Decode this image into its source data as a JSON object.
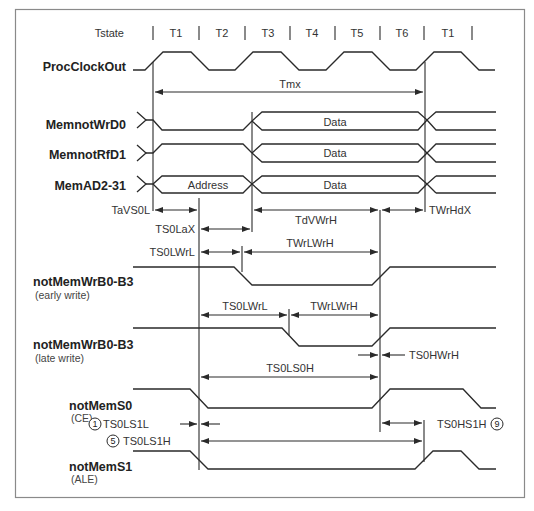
{
  "diagram": {
    "tstate_label": "Tstate",
    "tstates": [
      "T1",
      "T2",
      "T3",
      "T4",
      "T5",
      "T6",
      "T1"
    ],
    "signals": {
      "clock": "ProcClockOut",
      "wrd0": "MemnotWrD0",
      "rfd1": "MemnotRfD1",
      "ad": "MemAD2-31",
      "wr_early": "notMemWrB0-B3",
      "wr_early_sub": "(early write)",
      "wr_late": "notMemWrB0-B3",
      "wr_late_sub": "(late write)",
      "s0": "notMemS0",
      "s0_sub": "(CE)",
      "s1": "notMemS1",
      "s1_sub": "(ALE)"
    },
    "bus_labels": {
      "wrd0_data": "Data",
      "rfd1_data": "Data",
      "ad_address": "Address",
      "ad_data": "Data"
    },
    "timings": {
      "tmx": "Tmx",
      "tavs0l": "TaVS0L",
      "ts0lax": "TS0LaX",
      "tdvwrh": "TdVWrH",
      "twrhdx": "TWrHdX",
      "ts0lwrl_early": "TS0LWrL",
      "twrlwrh_early": "TWrLWrH",
      "ts0lwrl_late": "TS0LWrL",
      "twrlwrh_late": "TWrLWrH",
      "ts0hwrh": "TS0HWrH",
      "ts0ls0h": "TS0LS0H",
      "ts0ls1l": "TS0LS1L",
      "ts0hs1h": "TS0HS1H",
      "ts0ls1h": "TS0LS1H"
    },
    "callouts": {
      "ts0ls1l_num": "1",
      "ts0ls1h_num": "5",
      "ts0hs1h_num": "9"
    }
  }
}
